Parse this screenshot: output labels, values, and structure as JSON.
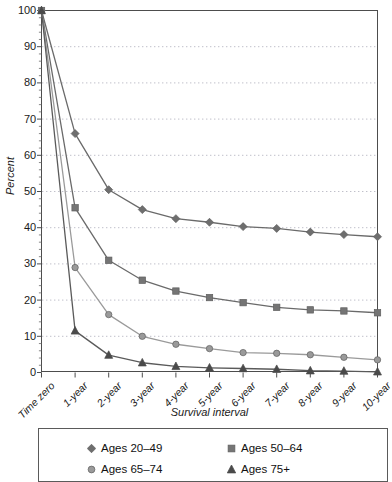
{
  "chart_data": {
    "type": "line",
    "title": "",
    "xlabel": "Survival interval",
    "ylabel": "Percent",
    "ylim": [
      0,
      100
    ],
    "ytick_step": 10,
    "yticks": [
      0,
      10,
      20,
      30,
      40,
      50,
      60,
      70,
      80,
      90,
      100
    ],
    "grid": "horizontal-dotted",
    "legend_position": "below-plot",
    "categories": [
      "Time zero",
      "1-year",
      "2-year",
      "3-year",
      "4-year",
      "5-year",
      "6-year",
      "7-year",
      "8-year",
      "9-year",
      "10-year"
    ],
    "series": [
      {
        "name": "Ages 20–49",
        "marker": "diamond",
        "color": "#6e6e6e",
        "line_color": "#6a6a6a",
        "values": [
          100,
          66,
          50.5,
          45,
          42.5,
          41.5,
          40.3,
          39.8,
          38.8,
          38.1,
          37.5
        ]
      },
      {
        "name": "Ages 50–64",
        "marker": "square",
        "color": "#757575",
        "line_color": "#6a6a6a",
        "values": [
          100,
          45.5,
          31,
          25.5,
          22.5,
          20.7,
          19.3,
          18,
          17.3,
          17,
          16.5
        ]
      },
      {
        "name": "Ages 65–74",
        "marker": "circle",
        "color": "#9a9a9a",
        "line_color": "#9a9a9a",
        "values": [
          100,
          29,
          16,
          10,
          7.8,
          6.6,
          5.5,
          5.3,
          4.9,
          4.2,
          3.5
        ]
      },
      {
        "name": "Ages 75+",
        "marker": "triangle",
        "color": "#4a4a4a",
        "line_color": "#5a5a5a",
        "values": [
          100,
          11.5,
          4.8,
          2.7,
          1.7,
          1.3,
          1.1,
          0.9,
          0.5,
          0.4,
          0.2
        ]
      }
    ]
  },
  "legend": {
    "entries": [
      {
        "label": "Ages 20–49",
        "marker": "diamond"
      },
      {
        "label": "Ages 50–64",
        "marker": "square"
      },
      {
        "label": "Ages 65–74",
        "marker": "circle"
      },
      {
        "label": "Ages 75+",
        "marker": "triangle"
      }
    ]
  },
  "axis": {
    "y_title": "Percent",
    "x_title": "Survival interval"
  }
}
